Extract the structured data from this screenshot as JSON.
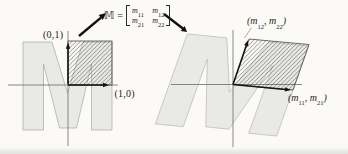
{
  "figure": {
    "matrix_expression": {
      "symbol": "𝕄",
      "equals": "=",
      "entries": {
        "m11": {
          "base": "m",
          "sub": "11"
        },
        "m12": {
          "base": "m",
          "sub": "12"
        },
        "m21": {
          "base": "m",
          "sub": "21"
        },
        "m22": {
          "base": "m",
          "sub": "22"
        }
      }
    },
    "left_panel": {
      "j_label": "(0,1)",
      "i_label": "(1,0)"
    },
    "right_panel": {
      "j_label": {
        "pre": "(m",
        "sub1": "12",
        "mid": ", m",
        "sub2": "22",
        "post": ")"
      },
      "i_label": {
        "pre": "(m",
        "sub1": "11",
        "mid": ", m",
        "sub2": "21",
        "post": ")"
      }
    },
    "colors": {
      "m_fill": "#e9e9e5",
      "m_stroke": "#a6a6a2",
      "axis": "#6b6b68",
      "hatch": "#47474b",
      "arrow": "#141414",
      "text": "#1e1e1e",
      "background": "#fbfaf7"
    }
  }
}
